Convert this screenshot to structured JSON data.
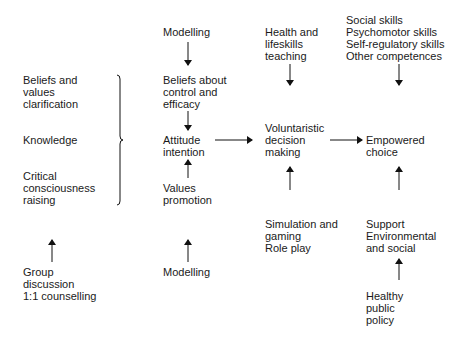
{
  "diagram": {
    "left_column": {
      "beliefs_values": [
        "Beliefs and",
        "values",
        "clarification"
      ],
      "knowledge": [
        "Knowledge"
      ],
      "critical_consciousness": [
        "Critical",
        "consciousness",
        "raising"
      ],
      "group_discussion": [
        "Group",
        "discussion",
        "1:1 counselling"
      ]
    },
    "column_two": {
      "modelling_top": [
        "Modelling"
      ],
      "beliefs_control": [
        "Beliefs about",
        "control and",
        "efficacy"
      ],
      "attitude": [
        "Attitude",
        "intention"
      ],
      "values_promotion": [
        "Values",
        "promotion"
      ],
      "modelling_bottom": [
        "Modelling"
      ]
    },
    "column_three": {
      "health_teaching": [
        "Health and",
        "lifeskills",
        "teaching"
      ],
      "decision": [
        "Voluntaristic",
        "decision",
        "making"
      ],
      "simulation": [
        "Simulation and",
        "gaming",
        "Role play"
      ]
    },
    "column_four": {
      "skills": [
        "Social skills",
        "Psychomotor skills",
        "Self-regulatory skills",
        "Other competences"
      ],
      "empowered": [
        "Empowered",
        "choice"
      ],
      "support": [
        "Support",
        "Environmental",
        "and social"
      ],
      "policy": [
        "Healthy",
        "public",
        "policy"
      ]
    },
    "connections": [
      {
        "from": "Modelling (top)",
        "to": "Beliefs about control and efficacy"
      },
      {
        "from": "Beliefs about control and efficacy",
        "to": "Attitude intention"
      },
      {
        "from": "Values promotion",
        "to": "Attitude intention"
      },
      {
        "from": "Modelling (bottom)",
        "to": "Values promotion"
      },
      {
        "from": "Beliefs/Knowledge/Critical consciousness (bracket)",
        "to": "Attitude intention"
      },
      {
        "from": "Group discussion 1:1 counselling",
        "to": "Critical consciousness raising"
      },
      {
        "from": "Attitude intention",
        "to": "Voluntaristic decision making"
      },
      {
        "from": "Health and lifeskills teaching",
        "to": "Voluntaristic decision making"
      },
      {
        "from": "Simulation and gaming Role play",
        "to": "Voluntaristic decision making"
      },
      {
        "from": "Voluntaristic decision making",
        "to": "Empowered choice"
      },
      {
        "from": "Skills",
        "to": "Empowered choice"
      },
      {
        "from": "Support Environmental and social",
        "to": "Empowered choice"
      },
      {
        "from": "Healthy public policy",
        "to": "Support Environmental and social"
      }
    ],
    "colors": {
      "text": "#1a1a1a",
      "line": "#111111",
      "background": "#ffffff"
    }
  }
}
